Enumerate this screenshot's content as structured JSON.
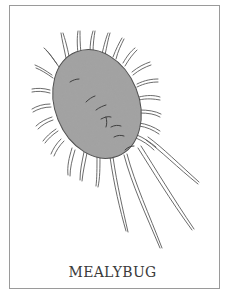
{
  "illustration": {
    "subject": "mealybug",
    "caption": "MEALYBUG",
    "colors": {
      "frame": "#9a9a9a",
      "body_fill": "#9c9c9c",
      "outline": "#4a4a4a",
      "caption": "#3a3a3a"
    }
  }
}
